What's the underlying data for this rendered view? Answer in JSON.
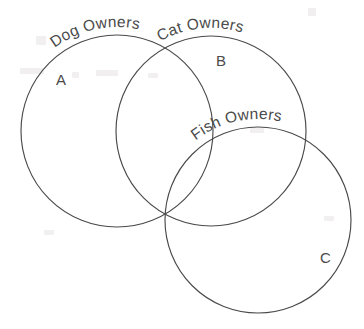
{
  "diagram": {
    "type": "venn",
    "kind": "three-circle-venn-diagram",
    "background_color": "#ffffff",
    "stroke_color": "#4a4a4a",
    "text_color": "#4a4a4a",
    "sets": [
      {
        "id": "dog",
        "curve_label": "Dog Owners",
        "region_label": "A",
        "center": [
          117,
          131
        ],
        "radius": 96
      },
      {
        "id": "cat",
        "curve_label": "Cat Owners",
        "region_label": "B",
        "center": [
          211,
          131
        ],
        "radius": 95
      },
      {
        "id": "fish",
        "curve_label": "Fish Owners",
        "region_label": "C",
        "center": [
          258,
          220
        ],
        "radius": 93
      }
    ],
    "region_labels": [
      {
        "text": "A",
        "x": 56,
        "y": 85
      },
      {
        "text": "B",
        "x": 216,
        "y": 66
      },
      {
        "text": "C",
        "x": 320,
        "y": 263
      }
    ],
    "curve_labels": [
      {
        "text": "Dog Owners",
        "set": "dog"
      },
      {
        "text": "Cat Owners",
        "set": "cat"
      },
      {
        "text": "Fish Owners",
        "set": "fish"
      }
    ]
  }
}
